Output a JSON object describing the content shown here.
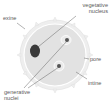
{
  "diagram": {
    "labels": {
      "exine": "exine",
      "vegetative_nucleus_line1": "vegetative",
      "vegetative_nucleus_line2": "nucleus",
      "pore": "pore",
      "intine": "intine",
      "generative_nuclei_line1": "generative",
      "generative_nuclei_line2": "nuclei"
    },
    "colors": {
      "grain_fill": "#e4e4e4",
      "grain_outline": "#ffffff",
      "nucleus": "#3a3a3a",
      "leader_line": "#555555",
      "label_text": "#5a5a5a"
    }
  }
}
